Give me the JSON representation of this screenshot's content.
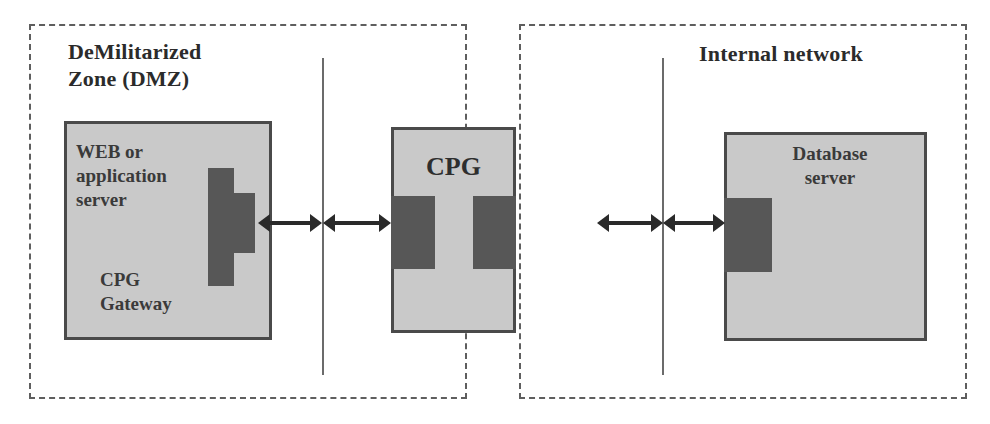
{
  "diagram": {
    "width": 990,
    "height": 424,
    "colors": {
      "background": "#ffffff",
      "zone_border": "#5e5e5e",
      "box_fill": "#c9c9c9",
      "box_border": "#4a4a4a",
      "connector_fill": "#575757",
      "arrow": "#2a2a2a",
      "firewall_line": "#6b6b6b",
      "text": "#3a3a3a"
    }
  },
  "zones": [
    {
      "id": "dmz",
      "label": "DeMilitarized\nZone (DMZ)"
    },
    {
      "id": "internal",
      "label": "Internal network"
    }
  ],
  "nodes": [
    {
      "id": "web",
      "label": "WEB or\napplication\nserver",
      "sublabel": "CPG\nGateway",
      "connector": "plug-connector"
    },
    {
      "id": "cpg",
      "label": "CPG",
      "connector_left": "socket-connector",
      "connector_right": "socket-connector"
    },
    {
      "id": "database",
      "label": "Database\nserver",
      "connector": "socket-connector"
    }
  ],
  "firewalls": [
    {
      "id": "firewall-left",
      "label": ""
    },
    {
      "id": "firewall-right",
      "label": ""
    }
  ],
  "links": [
    {
      "id": "web-to-firewall-left",
      "type": "bidirectional-arrow"
    },
    {
      "id": "firewall-left-to-cpg",
      "type": "bidirectional-arrow"
    },
    {
      "id": "cpg-to-firewall-right",
      "type": "bidirectional-arrow"
    },
    {
      "id": "firewall-right-to-db",
      "type": "bidirectional-arrow"
    }
  ]
}
